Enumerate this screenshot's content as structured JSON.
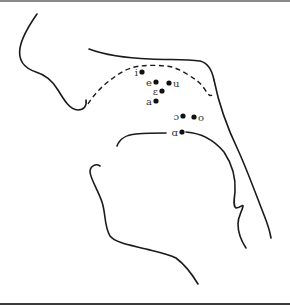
{
  "diagram": {
    "vowels": [
      {
        "label": "i",
        "label_side": "left"
      },
      {
        "label": "e",
        "label_side": "left"
      },
      {
        "label": "u",
        "label_side": "right"
      },
      {
        "label": "ɛ",
        "label_side": "left"
      },
      {
        "label": "a",
        "label_side": "left"
      },
      {
        "label": "ɔ",
        "label_side": "left"
      },
      {
        "label": "o",
        "label_side": "right"
      },
      {
        "label": "ɑ",
        "label_side": "left"
      }
    ],
    "outlines": [
      "face-profile",
      "palate",
      "tongue-outline-dashed",
      "pharynx-wall",
      "tongue-root",
      "lower-jaw"
    ],
    "colors": {
      "line": "#1a1a1a",
      "dot": "#111111",
      "label": "#333333"
    }
  }
}
